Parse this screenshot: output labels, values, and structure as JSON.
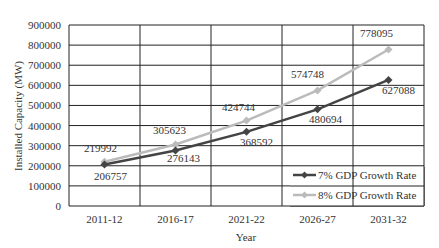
{
  "chart_data": {
    "type": "line",
    "title": "",
    "xlabel": "Year",
    "ylabel": "Installed Capacity (MW)",
    "categories": [
      "2011-12",
      "2016-17",
      "2021-22",
      "2026-27",
      "2031-32"
    ],
    "ylim": [
      0,
      900000
    ],
    "yticks": [
      0,
      100000,
      200000,
      300000,
      400000,
      500000,
      600000,
      700000,
      800000,
      900000
    ],
    "grid": true,
    "legend_position": "lower right inside",
    "series": [
      {
        "name": "7% GDP Growth Rate",
        "values": [
          206757,
          276143,
          368592,
          480694,
          627088
        ],
        "color": "#444444",
        "marker": "diamond"
      },
      {
        "name": "8% GDP Growth Rate",
        "values": [
          219992,
          305623,
          424744,
          574748,
          778095
        ],
        "color": "#bbbbbb",
        "marker": "diamond"
      }
    ]
  }
}
